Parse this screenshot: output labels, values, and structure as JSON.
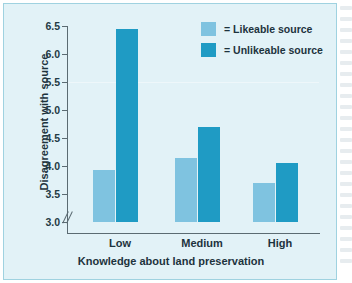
{
  "chart_data": {
    "type": "bar",
    "title": "",
    "categories": [
      "Low",
      "Medium",
      "High"
    ],
    "series": [
      {
        "name": "= Likeable source",
        "color": "#7fc3e0",
        "values": [
          3.93,
          4.15,
          3.7
        ]
      },
      {
        "name": "= Unlikeable source",
        "color": "#1f9bc4",
        "values": [
          6.45,
          4.7,
          4.05
        ]
      }
    ],
    "xlabel": "Knowledge about land preservation",
    "ylabel": "Disagreement with source",
    "ylim": [
      3.0,
      6.5
    ],
    "ytick_step": 0.5,
    "yticks": [
      "6.5",
      "6.0",
      "5.5",
      "5.0",
      "4.5",
      "4.0",
      "3.5",
      "3.0"
    ],
    "axis_break": true,
    "axis_break_symbol": "//",
    "grid": false,
    "legend_position": "top-right"
  },
  "legend": {
    "items": [
      {
        "label": "= Likeable source",
        "color": "#7fc3e0"
      },
      {
        "label": "= Unlikeable source",
        "color": "#1f9bc4"
      }
    ]
  },
  "colors": {
    "panel_background": "#e2f2f7",
    "panel_border": "#9fd2e0",
    "axis": "#5b6b72",
    "text": "#1d333d",
    "likeable": "#7fc3e0",
    "unlikeable": "#1f9bc4"
  }
}
